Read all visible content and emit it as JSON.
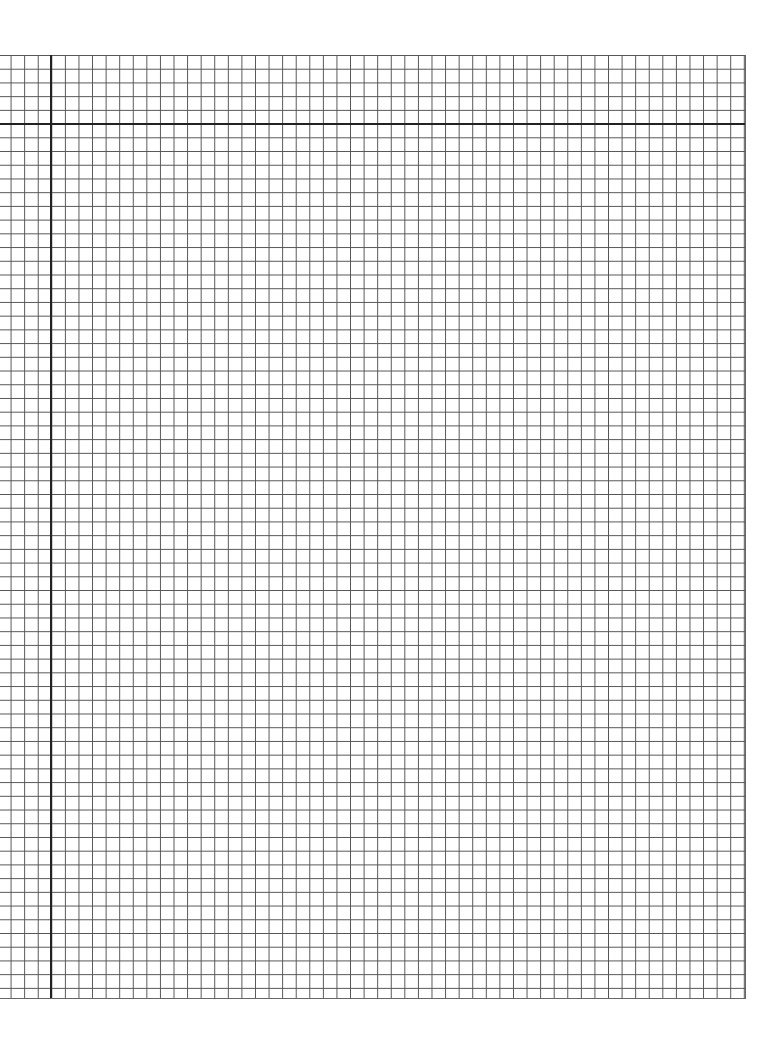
{
  "puzzle": {
    "type": "nonogram",
    "cell_w": 13.58,
    "cell_h": 13.72,
    "colors": {
      "filled_clue": "#111111",
      "clue_text": "#ffffff",
      "grid_line": "#555555",
      "thick_line": "#222222"
    }
  },
  "column_clues": [
    [
      1
    ],
    [
      1
    ],
    [
      3,
      2
    ],
    [
      4,
      3,
      2
    ],
    [
      5,
      4,
      2
    ],
    [
      16
    ],
    [
      17
    ],
    [
      14
    ],
    [
      8,
      6,
      4
    ],
    [
      6,
      1,
      11
    ],
    [
      6,
      11
    ],
    [
      8,
      9
    ],
    [
      27
    ],
    [
      30
    ],
    [
      2,
      27
    ],
    [
      29,
      1,
      1
    ],
    [
      30,
      3
    ],
    [
      4,
      23,
      1,
      1
    ],
    [
      3,
      20,
      5
    ],
    [
      19,
      4
    ],
    [
      20,
      2
    ],
    [
      22,
      2
    ],
    [
      19,
      5,
      1
    ],
    [
      18,
      4
    ],
    [
      17,
      4
    ],
    [
      17,
      3,
      1
    ],
    [
      18,
      5
    ],
    [
      18,
      2
    ],
    [
      19,
      2
    ],
    [
      15,
      6
    ],
    [
      14,
      4
    ],
    [
      14,
      1
    ],
    [
      13
    ],
    [
      13
    ],
    [
      5,
      12
    ],
    [
      19
    ],
    [
      18
    ],
    [
      17
    ],
    [
      14
    ],
    [
      9
    ],
    [
      11
    ],
    [
      6,
      5
    ],
    [
      5,
      6
    ],
    [
      3,
      7
    ],
    [
      7
    ],
    [
      8
    ],
    [
      3
    ]
  ],
  "row_clues": [
    [
      1
    ],
    [
      3
    ],
    [
      3,
      4,
      3
    ],
    [
      3,
      3,
      4
    ],
    [
      17
    ],
    [
      16
    ],
    [
      15
    ],
    [
      14
    ],
    [
      13
    ],
    [
      12
    ],
    [
      3,
      6
    ],
    [
      6,
      6,
      3
    ],
    [
      6,
      6,
      5,
      2
    ],
    [
      17,
      5,
      3
    ],
    [
      21,
      5,
      4
    ],
    [
      18,
      5,
      3
    ],
    [
      3,
      16,
      9
    ],
    [
      4,
      17,
      7,
      1
    ],
    [
      2,
      19,
      7,
      4
    ],
    [
      1,
      32,
      5
    ],
    [
      39
    ],
    [
      38
    ],
    [
      3,
      34
    ],
    [
      3,
      34
    ],
    [
      34
    ],
    [
      27
    ],
    [
      26
    ],
    [
      26
    ],
    [
      24
    ],
    [
      23
    ],
    [
      21
    ],
    [
      19
    ],
    [
      15
    ],
    [
      10
    ],
    [
      1,
      1
    ],
    [
      2,
      2
    ],
    [
      2,
      2
    ],
    [
      3,
      1,
      2
    ],
    [
      2,
      9,
      2
    ],
    [
      15
    ],
    [
      2,
      2,
      8
    ],
    [
      2,
      3,
      1,
      1
    ],
    [
      2,
      1
    ]
  ]
}
